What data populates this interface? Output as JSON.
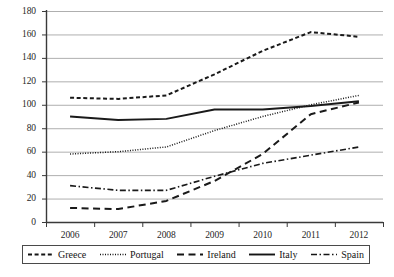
{
  "chart_data": {
    "type": "line",
    "title": "",
    "subtitle": "",
    "xlabel": "",
    "ylabel": "",
    "categories": [
      "2006",
      "2007",
      "2008",
      "2009",
      "2010",
      "2011",
      "2012"
    ],
    "ylim": [
      0,
      180
    ],
    "ytick_step": 20,
    "yticks": [
      0,
      20,
      40,
      60,
      80,
      100,
      120,
      140,
      160,
      180
    ],
    "grid": true,
    "grid_axis": "y",
    "legend_position": "bottom",
    "series": [
      {
        "name": "Greece",
        "style": "dashed",
        "color": "#1a1a1a",
        "values": [
          106,
          105,
          108,
          126,
          146,
          162,
          158
        ]
      },
      {
        "name": "Portugal",
        "style": "dotted",
        "color": "#1a1a1a",
        "values": [
          58,
          60,
          64,
          78,
          90,
          100,
          108
        ]
      },
      {
        "name": "Ireland",
        "style": "long-dashed",
        "color": "#1a1a1a",
        "values": [
          12,
          11,
          18,
          35,
          58,
          92,
          102
        ]
      },
      {
        "name": "Italy",
        "style": "solid",
        "color": "#1a1a1a",
        "values": [
          90,
          87,
          88,
          96,
          96,
          99,
          103
        ]
      },
      {
        "name": "Spain",
        "style": "dash-dot",
        "color": "#1a1a1a",
        "values": [
          31,
          27,
          27,
          39,
          50,
          57,
          64
        ]
      }
    ]
  },
  "legend": {
    "items": [
      {
        "label": "Greece",
        "swatch": "dashed-line-swatch"
      },
      {
        "label": "Portugal",
        "swatch": "dotted-line-swatch"
      },
      {
        "label": "Ireland",
        "swatch": "long-dashed-line-swatch"
      },
      {
        "label": "Italy",
        "swatch": "solid-line-swatch"
      },
      {
        "label": "Spain",
        "swatch": "dash-dot-line-swatch"
      }
    ]
  },
  "caption": {
    "text": ""
  }
}
